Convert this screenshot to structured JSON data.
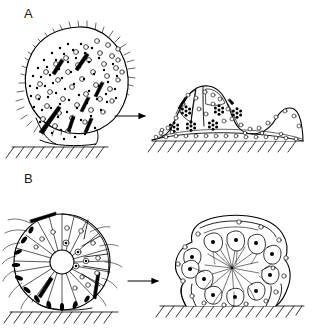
{
  "figure": {
    "background_color": "#ffffff",
    "ink_color": "#000000",
    "type": "scientific-line-drawing"
  },
  "panels": [
    {
      "id": "A",
      "label": "A",
      "arrow_label": "transition-arrow",
      "left": {
        "name": "ciliated-multinucleate-organism",
        "shape": "tilted-ellipse",
        "features": [
          "cilia-fringe",
          "open-vacuoles",
          "black-granules",
          "dark-spindle-nuclei"
        ],
        "substrate": "hatched-ground-line"
      },
      "right": {
        "name": "cellularized-mound",
        "shape": "two-lobed-dome",
        "features": [
          "rosette-cell-clusters",
          "basal-cell-layer",
          "open-vacuoles",
          "internal-lobe-cavities"
        ],
        "substrate": "hatched-ground-line"
      }
    },
    {
      "id": "B",
      "label": "B",
      "arrow_label": "transition-arrow",
      "left": {
        "name": "radial-colonial-sphere",
        "shape": "circle",
        "features": [
          "central-lumen",
          "radial-cell-boundaries",
          "peripheral-dark-nuclei",
          "open-vacuoles",
          "flagella-tufts"
        ],
        "substrate": "hatched-ground-line"
      },
      "right": {
        "name": "sessile-flagellated-chamber",
        "shape": "dome-with-stalk-feet",
        "features": [
          "flask-shaped-cells",
          "black-nuclei",
          "central-cavity",
          "radiating-flagella",
          "outer-vacuoles"
        ],
        "substrate": "hatched-ground-line"
      }
    }
  ]
}
